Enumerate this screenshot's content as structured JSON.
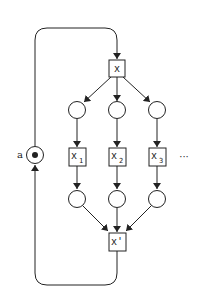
{
  "diagram": {
    "type": "petri-net",
    "place_a": {
      "label": "a",
      "marked": true
    },
    "transitions": {
      "fork": {
        "label": "x"
      },
      "branches": [
        {
          "label": "x",
          "subscript": "1"
        },
        {
          "label": "x",
          "subscript": "2"
        },
        {
          "label": "x",
          "subscript": "3"
        }
      ],
      "join": {
        "label": "x'"
      }
    },
    "continuation": "···",
    "colors": {
      "stroke": "#222222",
      "background": "#ffffff"
    }
  }
}
